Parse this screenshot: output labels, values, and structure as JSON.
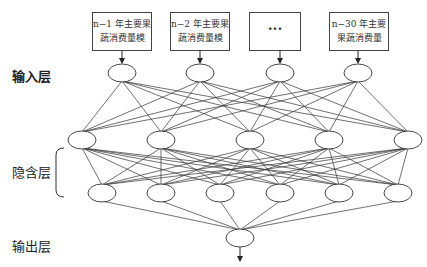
{
  "diagram": {
    "type": "neural-network",
    "inputs": [
      {
        "line1": "n−1 年主要果",
        "line2": "蔬消费量模"
      },
      {
        "line1": "n−2 年主要果",
        "line2": "蔬消费量模"
      },
      {
        "line1": "···",
        "line2": ""
      },
      {
        "line1": "n−30 年主要",
        "line2": "果蔬消费量"
      }
    ],
    "layer_labels": {
      "input": "输入层",
      "hidden": "隐含层",
      "output": "输出层"
    },
    "layers": {
      "input_nodes": 4,
      "hidden1_nodes": 5,
      "hidden2_nodes": 6,
      "output_nodes": 1
    },
    "colors": {
      "stroke": "#333333",
      "background": "#ffffff"
    }
  }
}
